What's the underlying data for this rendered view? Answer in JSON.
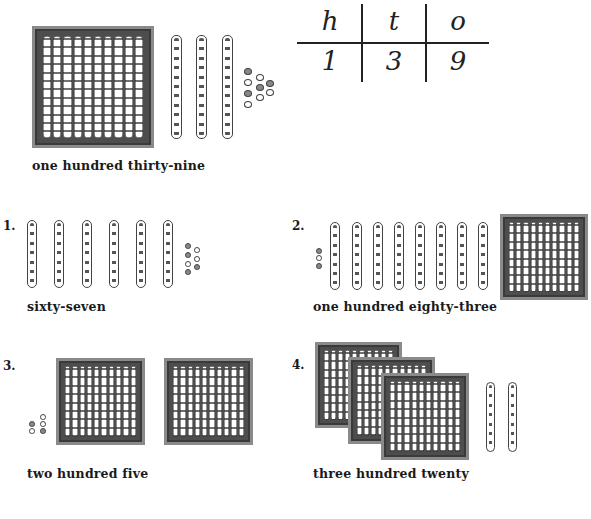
{
  "example": {
    "label": "one hundred thirty-nine",
    "place_value_table": {
      "headers": [
        "h",
        "t",
        "o"
      ],
      "values": [
        "1",
        "3",
        "9"
      ]
    },
    "blocks": {
      "hundreds": 1,
      "tens": 3,
      "ones": 9
    }
  },
  "exercises": [
    {
      "number": "1.",
      "label": "sixty-seven",
      "blocks": {
        "hundreds": 0,
        "tens": 6,
        "ones": 7
      }
    },
    {
      "number": "2.",
      "label": "one hundred eighty-three",
      "blocks": {
        "hundreds": 1,
        "tens": 8,
        "ones": 3
      }
    },
    {
      "number": "3.",
      "label": "two hundred five",
      "blocks": {
        "hundreds": 2,
        "tens": 0,
        "ones": 5
      }
    },
    {
      "number": "4.",
      "label": "three hundred twenty",
      "blocks": {
        "hundreds": 3,
        "tens": 2,
        "ones": 0
      }
    }
  ]
}
